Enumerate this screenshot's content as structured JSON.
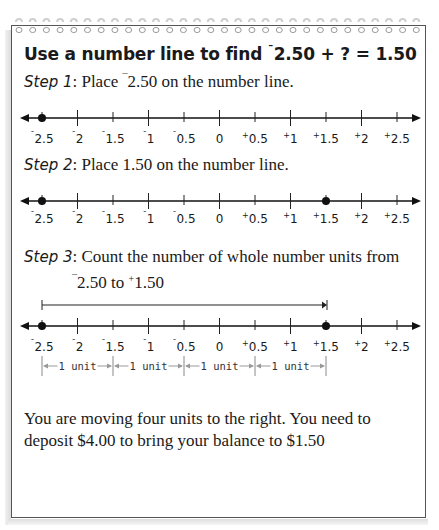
{
  "title": {
    "prefix": "Use a number line to find ",
    "neg_sign": "¯",
    "expression": "2.50 + ? = 1.50"
  },
  "steps": [
    {
      "label": "Step 1",
      "text_before": ": Place ",
      "neg_sign": "¯",
      "text_after": "2.50 on the number line."
    },
    {
      "label": "Step 2",
      "text_before": ": Place 1.50 on the number line.",
      "neg_sign": "",
      "text_after": ""
    },
    {
      "label": "Step 3",
      "text_before": ": Count the number of whole number units from",
      "line2_neg": "¯",
      "line2_a": "2.50 to ",
      "line2_pos": "+",
      "line2_b": "1.50"
    }
  ],
  "number_line": {
    "ticks": [
      {
        "sign": "¯",
        "value": "2.5"
      },
      {
        "sign": "¯",
        "value": "2"
      },
      {
        "sign": "¯",
        "value": "1.5"
      },
      {
        "sign": "¯",
        "value": "1"
      },
      {
        "sign": "¯",
        "value": "0.5"
      },
      {
        "sign": "",
        "value": "0"
      },
      {
        "sign": "+",
        "value": "0.5"
      },
      {
        "sign": "+",
        "value": "1"
      },
      {
        "sign": "+",
        "value": "1.5"
      },
      {
        "sign": "+",
        "value": "2"
      },
      {
        "sign": "+",
        "value": "2.5"
      }
    ],
    "line1_points": [
      "-2.5"
    ],
    "line2_points": [
      "-2.5",
      "+1.5"
    ],
    "line3_points": [
      "-2.5",
      "+1.5"
    ],
    "unit_label": "1 unit",
    "unit_count": 4
  },
  "conclusion": {
    "text": "You are moving four units to the right. You need to deposit $4.00 to bring your balance to $1.50"
  }
}
